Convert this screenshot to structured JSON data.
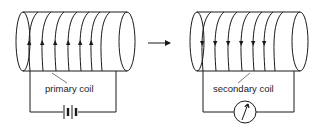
{
  "diagram": {
    "type": "electromagnetic-induction",
    "colors": {
      "stroke": "#1a1a1a",
      "label": "#222222",
      "background": "#ffffff"
    },
    "primary": {
      "label": "primary coil",
      "current_direction": "up",
      "turns": 6,
      "source": "battery"
    },
    "secondary": {
      "label": "secondary coil",
      "current_direction": "down",
      "turns": 6,
      "instrument": "meter"
    },
    "connector": {
      "kind": "arrow",
      "direction": "right"
    }
  }
}
